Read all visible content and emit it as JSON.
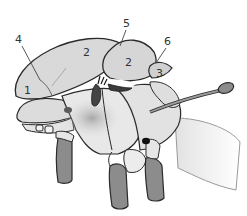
{
  "diagram": {
    "type": "anatomical-illustration",
    "labels": [
      {
        "id": "label-1",
        "text": "1",
        "x": 24,
        "y": 94
      },
      {
        "id": "label-2a",
        "text": "2",
        "x": 83,
        "y": 56
      },
      {
        "id": "label-2b",
        "text": "2",
        "x": 125,
        "y": 66
      },
      {
        "id": "label-3",
        "text": "3",
        "x": 156,
        "y": 77
      },
      {
        "id": "label-4",
        "text": "4",
        "x": 15,
        "y": 43
      },
      {
        "id": "label-5",
        "text": "5",
        "x": 123,
        "y": 27
      },
      {
        "id": "label-6",
        "text": "6",
        "x": 164,
        "y": 45
      }
    ],
    "colors": {
      "background": "#ffffff",
      "plate_fill": "#d9d9d9",
      "plate_light": "#e6e6e6",
      "leg_fill": "#8c8c8c",
      "outline": "#2b2b2b",
      "dark_spot": "#1a1a1a",
      "label_text": "#333333"
    }
  }
}
